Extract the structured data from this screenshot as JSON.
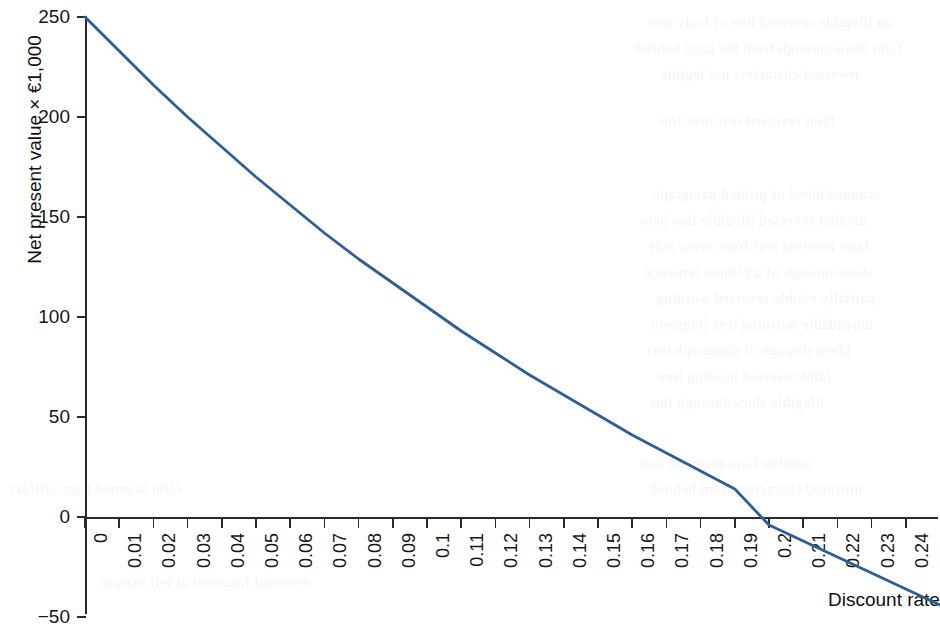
{
  "figure": {
    "background_color": "#ffffff",
    "line_color": "#2e5f94",
    "axis_color": "#2a2a2a",
    "text_color": "#161616"
  },
  "axes": {
    "y_title": "Net present value × €1,000",
    "x_title": "Discount rate",
    "y_ticks": [
      "250",
      "200",
      "150",
      "100",
      "50",
      "0",
      "-50"
    ],
    "x_ticks": [
      "0",
      "0.01",
      "0.02",
      "0.03",
      "0.04",
      "0.05",
      "0.06",
      "0.07",
      "0.08",
      "0.09",
      "0.1",
      "0.11",
      "0.12",
      "0.13",
      "0.14",
      "0.15",
      "0.16",
      "0.17",
      "0.18",
      "0.19",
      "0.2",
      "0.21",
      "0.22",
      "0.23",
      "0.24",
      "0.25"
    ]
  },
  "bleed_through_lines": [
    {
      "text": "an illegible reversed line of body text",
      "x": 648,
      "y": 14,
      "size": 15
    },
    {
      "text": "faint show-through from the page behind",
      "x": 636,
      "y": 40,
      "size": 15
    },
    {
      "text": "reversed characters not legible",
      "x": 660,
      "y": 66,
      "size": 15
    },
    {
      "text": "scanned bleed of printed paragraph",
      "x": 652,
      "y": 186,
      "size": 15
    },
    {
      "text": "another reversed illegible line here",
      "x": 640,
      "y": 212,
      "size": 15
    },
    {
      "text": "faint inverted text from verso side",
      "x": 648,
      "y": 238,
      "size": 15
    },
    {
      "text": "show-through of a printed sentence",
      "x": 644,
      "y": 264,
      "size": 15
    },
    {
      "text": "partially visible reversed wording",
      "x": 656,
      "y": 290,
      "size": 15
    },
    {
      "text": "unreadable mirrored text fragment",
      "x": 650,
      "y": 316,
      "size": 15
    },
    {
      "text": "bleed through of paragraph text",
      "x": 646,
      "y": 342,
      "size": 15
    },
    {
      "text": "faint reversed heading line",
      "x": 658,
      "y": 368,
      "size": 15
    },
    {
      "text": "illegible show-through line",
      "x": 648,
      "y": 394,
      "size": 15
    },
    {
      "text": "another faint reversed line",
      "x": 640,
      "y": 455,
      "size": 15
    },
    {
      "text": "mirrored characters from behind",
      "x": 652,
      "y": 481,
      "size": 15
    },
    {
      "text": "faint scanned page artifact",
      "x": 10,
      "y": 480,
      "size": 15
    },
    {
      "text": "reversed fragment at left margin",
      "x": 100,
      "y": 574,
      "size": 15
    },
    {
      "text": "faint reversed text near top",
      "x": 660,
      "y": 112,
      "size": 15
    }
  ],
  "chart_data": {
    "type": "line",
    "title": "",
    "xlabel": "Discount rate",
    "ylabel": "Net present value × €1,000",
    "xlim": [
      0,
      0.25
    ],
    "ylim": [
      -50,
      250
    ],
    "grid": false,
    "legend": false,
    "irr_crossing": 0.1945,
    "series": [
      {
        "name": "Net present value",
        "color": "#2e5f94",
        "x": [
          0,
          0.01,
          0.02,
          0.03,
          0.04,
          0.05,
          0.06,
          0.07,
          0.08,
          0.09,
          0.1,
          0.11,
          0.12,
          0.13,
          0.14,
          0.15,
          0.16,
          0.17,
          0.18,
          0.19,
          0.2,
          0.21,
          0.22,
          0.23,
          0.24,
          0.25
        ],
        "values": [
          250,
          233,
          216,
          200,
          185,
          170,
          156,
          142,
          129,
          117,
          105,
          93,
          82,
          71,
          61,
          51,
          41,
          32,
          23,
          14,
          -4,
          -12,
          -20,
          -28,
          -36,
          -44
        ]
      }
    ]
  }
}
